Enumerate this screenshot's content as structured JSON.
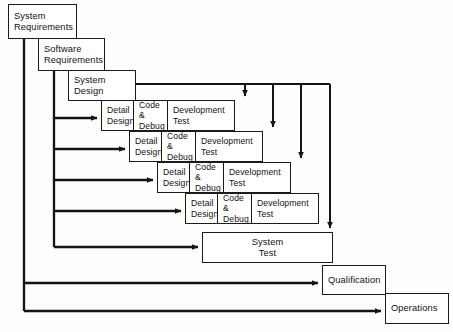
{
  "diagram": {
    "type": "flow-diagram",
    "background_color": "#fdfdfc",
    "line_color": "#141414",
    "box_fill": "#ffffff",
    "box_border_color": "#1a1a1a",
    "stages": {
      "system_requirements": "System\nRequirements",
      "software_requirements": "Software\nRequirements",
      "system_design": "System\nDesign",
      "system_test": "System\nTest",
      "qualification": "Qualification",
      "operations": "Operations"
    },
    "build_rows": [
      {
        "row": 1,
        "detail_design": "Detail\nDesign",
        "code_debug": "Code &\nDebug",
        "development_test": "Development\nTest"
      },
      {
        "row": 2,
        "detail_design": "Detail\nDesign",
        "code_debug": "Code &\nDebug",
        "development_test": "Development\nTest"
      },
      {
        "row": 3,
        "detail_design": "Detail\nDesign",
        "code_debug": "Code &\nDebug",
        "development_test": "Development\nTest"
      },
      {
        "row": 4,
        "detail_design": "Detail\nDesign",
        "code_debug": "Code &\nDebug",
        "development_test": "Development\nTest"
      }
    ]
  }
}
